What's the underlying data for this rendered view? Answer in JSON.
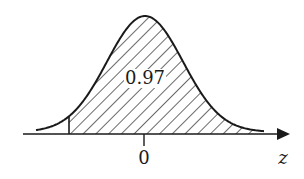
{
  "chart_data": {
    "type": "area",
    "title": "",
    "xlabel": "z",
    "ylabel": "",
    "x_ticks": [
      "0"
    ],
    "shaded_region": {
      "from": "cutoff (left of 0)",
      "to": "+inf"
    },
    "annotation": "0.97",
    "shaded_area": 0.97,
    "grid": false,
    "legend": null
  },
  "labels": {
    "area": "0.97",
    "tick_zero": "0",
    "axis_var": "z"
  },
  "colors": {
    "ink": "#1a1a1a",
    "background": "#ffffff"
  }
}
